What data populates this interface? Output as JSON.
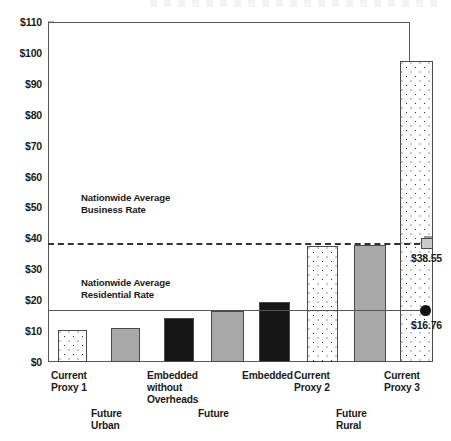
{
  "chart_data": {
    "type": "bar",
    "title": "",
    "xlabel": "",
    "ylabel": "",
    "ylim": [
      0,
      110
    ],
    "ytick_step": 10,
    "grid": false,
    "legend": "none",
    "currency_prefix": "$",
    "categories": [
      "Current\nProxy 1",
      "Future\nUrban",
      "Embedded\nwithout\nOverheads",
      "Future",
      "Embedded",
      "Current\nProxy 2",
      "Future\nRural",
      "Current\nProxy 3"
    ],
    "values": [
      10.2,
      11.1,
      14.2,
      16.4,
      19.5,
      37.6,
      37.8,
      97.5
    ],
    "bar_styles": [
      "dotted",
      "gray",
      "black",
      "gray",
      "black",
      "dotted",
      "gray",
      "dotted"
    ],
    "ytick_labels": [
      "$0",
      "$10",
      "$20",
      "$30",
      "$40",
      "$50",
      "$60",
      "$70",
      "$80",
      "$90",
      "$100",
      "$110"
    ],
    "ytick_values": [
      0,
      10,
      20,
      30,
      40,
      50,
      60,
      70,
      80,
      90,
      100,
      110
    ],
    "reference_lines": [
      {
        "name": "business-rate",
        "value": 38.55,
        "style": "dashed",
        "marker": "square",
        "marker_label": "$38.55",
        "annotation": "Nationwide Average\nBusiness Rate"
      },
      {
        "name": "residential-rate",
        "value": 16.76,
        "style": "solid",
        "marker": "circle",
        "marker_label": "$16.76",
        "annotation": "Nationwide Average\nResidential Rate"
      }
    ]
  },
  "colors": {
    "bar_gray": "#a8a8a8",
    "bar_black": "#161616",
    "bar_outline": "#4a4a4a",
    "frame": "#5a5a5a",
    "text": "#1a1a1a"
  }
}
